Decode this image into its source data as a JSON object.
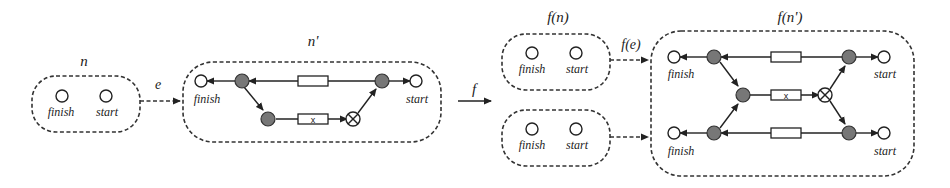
{
  "diagram": {
    "left": {
      "node_n": {
        "label": "n",
        "places": [
          {
            "label": "finish"
          },
          {
            "label": "start"
          }
        ]
      },
      "edge_e": {
        "label": "e"
      },
      "node_n_prime": {
        "label": "n'",
        "places": [
          {
            "label": "finish"
          },
          {
            "label": "start"
          }
        ],
        "transition_x_label": "x"
      }
    },
    "mapping": {
      "label": "f"
    },
    "right": {
      "node_fn": {
        "label": "f(n)",
        "places": [
          {
            "label": "finish"
          },
          {
            "label": "start"
          }
        ]
      },
      "node_fn_copy": {
        "places": [
          {
            "label": "finish"
          },
          {
            "label": "start"
          }
        ]
      },
      "edge_fe": {
        "label": "f(e)"
      },
      "node_fn_prime": {
        "label": "f(n')",
        "places": [
          {
            "label": "finish"
          },
          {
            "label": "start"
          },
          {
            "label": "finish"
          },
          {
            "label": "start"
          }
        ],
        "transition_x_label": "x"
      }
    }
  }
}
